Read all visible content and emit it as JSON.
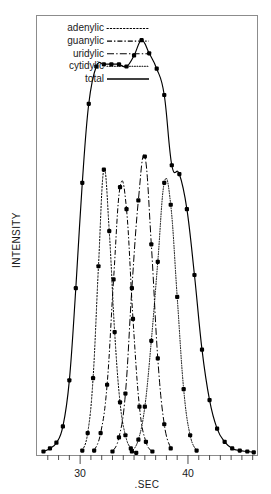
{
  "chart_data": {
    "type": "line",
    "title": "",
    "xlabel": ".SEC",
    "ylabel": "INTENSITY",
    "xlim": [
      26.0,
      46.4
    ],
    "ylim": [
      0,
      100
    ],
    "grid": false,
    "legend_position": "top-left",
    "xticks_major": [
      30,
      40
    ],
    "xtick_labels": [
      "30",
      "40"
    ],
    "xticks_minor": [
      27,
      28,
      29,
      31,
      32,
      33,
      34,
      35,
      36,
      37,
      38,
      39,
      41,
      42,
      43,
      44,
      45,
      46
    ],
    "series": [
      {
        "name": "adenylic",
        "style": "dotted",
        "markers": true,
        "x": [
          30.2,
          30.7,
          31.2,
          31.7,
          32.2,
          32.7,
          33.2,
          33.7,
          34.2,
          34.7,
          35.2
        ],
        "y": [
          1.0,
          5.0,
          17.5,
          43.0,
          65.0,
          51.0,
          28.0,
          12.0,
          4.5,
          1.5,
          0.5
        ]
      },
      {
        "name": "guanylic",
        "style": "dashdot",
        "markers": true,
        "x": [
          31.3,
          31.9,
          32.5,
          33.1,
          33.7,
          34.3,
          34.9,
          35.5,
          36.1,
          36.7
        ],
        "y": [
          1.0,
          5.0,
          16.0,
          40.0,
          61.0,
          56.0,
          31.0,
          11.0,
          3.0,
          0.8
        ]
      },
      {
        "name": "uridylic",
        "style": "dashdot-long",
        "markers": true,
        "x": [
          33.0,
          33.6,
          34.2,
          34.8,
          35.4,
          36.0,
          36.6,
          37.2,
          37.8,
          38.4
        ],
        "y": [
          0.8,
          4.0,
          14.0,
          38.0,
          58.0,
          68.0,
          48.0,
          22.0,
          7.0,
          1.5
        ]
      },
      {
        "name": "cytidylic",
        "style": "fine-dotted",
        "markers": true,
        "x": [
          34.8,
          35.4,
          36.0,
          36.6,
          37.2,
          37.8,
          38.4,
          39.0,
          39.6,
          40.2,
          40.8
        ],
        "y": [
          0.8,
          3.5,
          11.0,
          26.0,
          44.0,
          62.0,
          57.0,
          36.0,
          15.0,
          4.5,
          1.0
        ]
      },
      {
        "name": "total",
        "style": "solid",
        "markers": true,
        "x": [
          26.6,
          27.2,
          27.8,
          28.4,
          29.0,
          29.6,
          30.2,
          30.8,
          31.5,
          32.2,
          32.9,
          33.6,
          34.3,
          35.0,
          35.7,
          36.4,
          37.1,
          37.8,
          38.5,
          39.2,
          39.9,
          40.6,
          41.3,
          42.0,
          42.7,
          43.4,
          44.1,
          44.8,
          45.5,
          46.1
        ],
        "y": [
          0.8,
          1.5,
          2.8,
          6.5,
          17.0,
          38.0,
          62.0,
          80.0,
          88.5,
          89.0,
          89.0,
          89.0,
          88.5,
          91.0,
          94.5,
          91.5,
          88.0,
          82.0,
          66.0,
          64.0,
          56.0,
          41.0,
          24.0,
          12.5,
          6.0,
          3.0,
          1.5,
          1.0,
          0.8,
          0.6
        ]
      }
    ],
    "legend_entries": [
      {
        "label": "adenylic",
        "style": "dotted"
      },
      {
        "label": "guanylic",
        "style": "dashdot"
      },
      {
        "label": "uridylic",
        "style": "dashdot-long"
      },
      {
        "label": "cytidylic",
        "style": "fine-dotted"
      },
      {
        "label": "total",
        "style": "solid"
      }
    ],
    "colors": {
      "line": "#000000",
      "axis": "#4d4d4d",
      "frame": "#808080",
      "background": "#ffffff",
      "marker": "#000000"
    }
  }
}
